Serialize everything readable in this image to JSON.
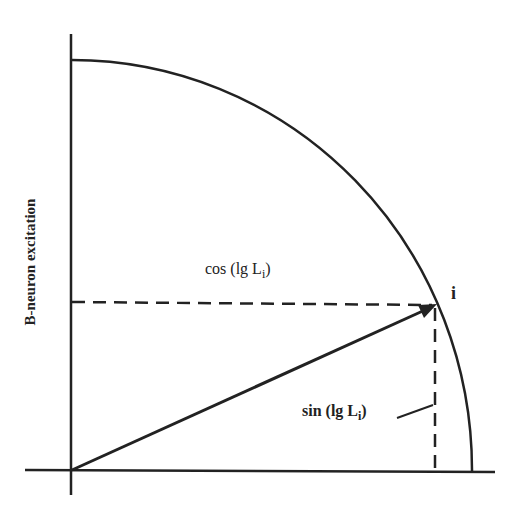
{
  "diagram": {
    "y_axis_label": "B-neuron excitation",
    "cos_label": "cos (lg L",
    "cos_sub": "i",
    "cos_close": ")",
    "sin_label": "sin (lg L",
    "sin_sub": "i",
    "sin_close": ")",
    "point_label": "i",
    "stroke_color": "#222222"
  }
}
